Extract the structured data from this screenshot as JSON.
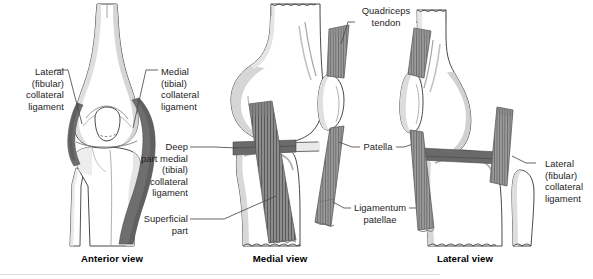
{
  "figure": {
    "background_color": "#ffffff",
    "bone_fill": "#ffffff",
    "bone_outline": "#3a3a3a",
    "cartilage_shadow": "#c8c8c8",
    "ligament_dark": "#6e6e6e",
    "ligament_mid": "#8a8a8a",
    "tendon_striation": "#555555",
    "leader_line_color": "#4a4a4a",
    "text_color": "#1d1d1d"
  },
  "labels": {
    "lateral_collateral_left": "Lateral\n(fibular)\ncollateral\nligament",
    "medial_collateral": "Medial\n(tibial)\ncollateral\nligament",
    "deep_part_medial": "Deep\npart medial\n(tibial)\ncollateral\nligament",
    "superficial_part": "Superficial\npart",
    "quadriceps_tendon": "Quadriceps\ntendon",
    "patella": "Patella",
    "ligamentum_patellae": "Ligamentum\npatellae",
    "lateral_collateral_right": "Lateral\n(fibular)\ncollateral\nligament"
  },
  "captions": {
    "anterior": "Anterior view",
    "medial": "Medial view",
    "lateral": "Lateral view"
  },
  "panels": [
    {
      "id": "anterior",
      "caption": "Anterior view",
      "structures": [
        "femur",
        "patella",
        "tibia",
        "fibula",
        "lateral (fibular) collateral ligament",
        "medial (tibial) collateral ligament"
      ]
    },
    {
      "id": "medial",
      "caption": "Medial view",
      "structures": [
        "femur",
        "patella",
        "tibia",
        "quadriceps tendon",
        "ligamentum patellae",
        "superficial part of medial collateral ligament",
        "deep part of medial collateral ligament"
      ]
    },
    {
      "id": "lateral",
      "caption": "Lateral view",
      "structures": [
        "femur",
        "patella",
        "tibia",
        "fibula",
        "quadriceps tendon",
        "ligamentum patellae",
        "lateral (fibular) collateral ligament"
      ]
    }
  ]
}
